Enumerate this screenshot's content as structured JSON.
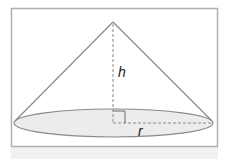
{
  "diagram": {
    "type": "cone",
    "labels": {
      "height": "h",
      "radius": "r"
    },
    "colors": {
      "frame": "#b0b0b0",
      "outline": "#8a8a8a",
      "base_fill": "#ececec",
      "dashed": "#8a8a8a",
      "label": "#222222"
    },
    "features": [
      "apex",
      "slant-sides",
      "elliptical-base",
      "dashed-height",
      "dashed-radius",
      "right-angle-marker"
    ]
  }
}
